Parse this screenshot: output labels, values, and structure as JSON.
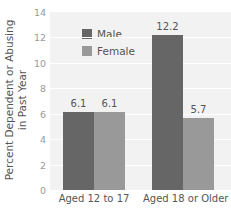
{
  "chart_data": {
    "type": "bar",
    "title": "",
    "xlabel": "",
    "ylabel": "Percent Dependent or Abusing in Past Year",
    "ylabel_lines": [
      "Percent Dependent or Abusing",
      "in Past Year"
    ],
    "categories": [
      "Aged 12 to 17",
      "Aged 18 or  Older"
    ],
    "series": [
      {
        "name": "Male",
        "values": [
          6.1,
          12.2
        ],
        "color": "#666666"
      },
      {
        "name": "Female",
        "values": [
          6.1,
          5.7
        ],
        "color": "#999999"
      }
    ],
    "data_labels": [
      [
        "6.1",
        "12.2"
      ],
      [
        "6.1",
        "5.7"
      ]
    ],
    "ylim": [
      0,
      14
    ],
    "yticks": [
      "0",
      "2",
      "4",
      "6",
      "8",
      "10",
      "12",
      "14"
    ],
    "grid": true,
    "legend_position": "upper-left inside"
  }
}
